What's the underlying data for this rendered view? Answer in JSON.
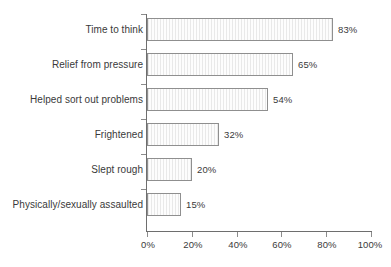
{
  "chart_data": {
    "type": "bar",
    "orientation": "horizontal",
    "title": "",
    "subtitle": "",
    "xlabel": "",
    "ylabel": "",
    "xlim": [
      0,
      100
    ],
    "xunit": "%",
    "grid": false,
    "legend": null,
    "categories": [
      "Time to think",
      "Relief from pressure",
      "Helped sort out problems",
      "Frightened",
      "Slept rough",
      "Physically/sexually assaulted"
    ],
    "values": [
      83,
      65,
      54,
      32,
      20,
      15
    ],
    "data_labels": [
      "83%",
      "65%",
      "54%",
      "32%",
      "20%",
      "15%"
    ],
    "xticks": [
      0,
      20,
      40,
      60,
      80,
      100
    ],
    "xtick_labels": [
      "0%",
      "20%",
      "40%",
      "60%",
      "80%",
      "100%"
    ],
    "colors": {
      "bar_fill": "#fbfbfb",
      "bar_hatch": "#e9e9e9",
      "bar_border": "#8f8f8f",
      "axis": "#6e6e6e",
      "text": "#3a3a3a",
      "background": "#ffffff"
    }
  }
}
